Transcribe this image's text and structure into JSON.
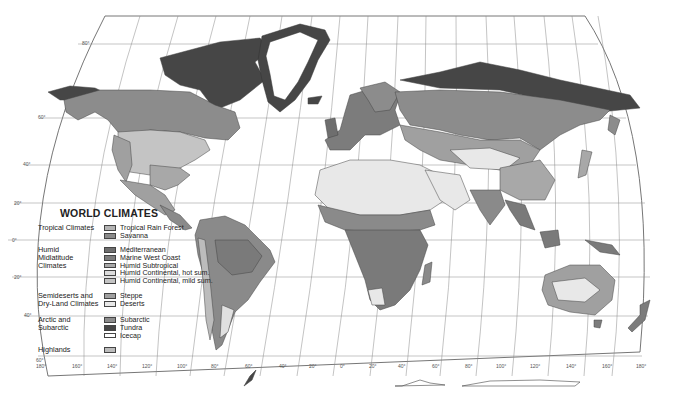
{
  "legend": {
    "title": "WORLD CLIMATES",
    "groups": [
      {
        "label": "Tropical Climates",
        "items": [
          {
            "label": "Tropical Rain Forest",
            "color": "#b4b4b4"
          },
          {
            "label": "Savanna",
            "color": "#8a8a8a"
          }
        ]
      },
      {
        "label": "Humid\nMidlatitude\nClimates",
        "items": [
          {
            "label": "Mediterranean",
            "color": "#6e6e6e"
          },
          {
            "label": "Marine West Coast",
            "color": "#7c7c7c"
          },
          {
            "label": "Humid Subtropical",
            "color": "#a8a8a8"
          },
          {
            "label": "Humid Continental, hot sum.",
            "color": "#dcdcdc"
          },
          {
            "label": "Humid Continental, mild sum.",
            "color": "#c4c4c4"
          }
        ]
      },
      {
        "label": "Semideserts and\nDry-Land Climates",
        "items": [
          {
            "label": "Steppe",
            "color": "#a0a0a0"
          },
          {
            "label": "Deserts",
            "color": "#e8e8e8"
          }
        ]
      },
      {
        "label": "Arctic and\nSubarctic",
        "items": [
          {
            "label": "Subarctic",
            "color": "#8c8c8c"
          },
          {
            "label": "Tundra",
            "color": "#464646"
          },
          {
            "label": "Icecap",
            "color": "#ffffff"
          }
        ]
      },
      {
        "label": "Highlands",
        "items": [
          {
            "label": "",
            "color": "#bcbcbc"
          }
        ]
      }
    ]
  },
  "latitude_labels": [
    "80°",
    "60°",
    "40°",
    "20°",
    "0°",
    "20°",
    "40°",
    "60°"
  ],
  "longitude_labels": [
    "180°",
    "160°",
    "140°",
    "120°",
    "100°",
    "80°",
    "60°",
    "40°",
    "20°",
    "0°",
    "20°",
    "40°",
    "60°",
    "80°",
    "100°",
    "120°",
    "140°",
    "160°",
    "180°"
  ],
  "colors": {
    "subarctic": "#8c8c8c",
    "tundra": "#464646",
    "desert": "#e8e8e8",
    "savanna": "#8a8a8a",
    "rainforest": "#7a7a7a",
    "grid": "#777777",
    "background": "#ffffff"
  }
}
